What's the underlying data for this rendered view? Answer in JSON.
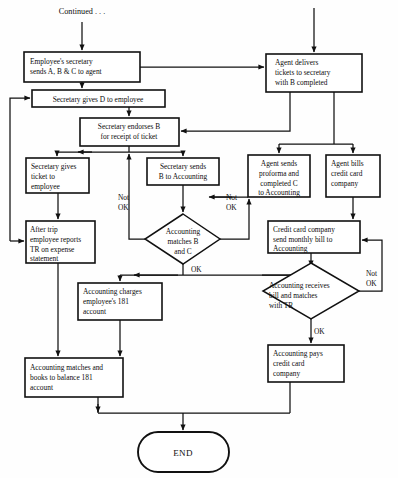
{
  "diagram": {
    "type": "flowchart",
    "canvas": {
      "width": 398,
      "height": 478
    },
    "colors": {
      "stroke": "#111111",
      "fill": "#ffffff",
      "text": "#0d0d0d",
      "background": "#ffffff"
    }
  },
  "entry": {
    "label": "Continued . . ."
  },
  "nodes": [
    {
      "id": "employee-secretary-sends",
      "shape": "process",
      "lines": [
        "Employee's secretary",
        "sends A, B & C to agent"
      ],
      "x": 24,
      "y": 52,
      "w": 116,
      "h": 30
    },
    {
      "id": "agent-delivers-tickets",
      "shape": "process",
      "lines": [
        "Agent delivers",
        "tickets to secretary",
        "with B completed"
      ],
      "x": 266,
      "y": 54,
      "w": 96,
      "h": 38
    },
    {
      "id": "secretary-gives-d",
      "shape": "process",
      "lines": [
        "Secretary gives D to employee"
      ],
      "x": 32,
      "y": 90,
      "w": 133,
      "h": 17
    },
    {
      "id": "secretary-endorses-b",
      "shape": "process",
      "lines": [
        "Secretary endorses B",
        "for receipt of ticket"
      ],
      "x": 80,
      "y": 118,
      "w": 99,
      "h": 28
    },
    {
      "id": "secretary-gives-ticket",
      "shape": "process",
      "lines": [
        "Secretary gives",
        "ticket to",
        "employee"
      ],
      "x": 26,
      "y": 158,
      "w": 63,
      "h": 35
    },
    {
      "id": "secretary-sends-b",
      "shape": "process",
      "lines": [
        "Secretary sends",
        "B to Accounting"
      ],
      "x": 147,
      "y": 158,
      "w": 72,
      "h": 27
    },
    {
      "id": "agent-sends-proforma",
      "shape": "process",
      "lines": [
        "Agent sends",
        "proforma and",
        "completed C",
        "to Accounting"
      ],
      "x": 248,
      "y": 155,
      "w": 62,
      "h": 42
    },
    {
      "id": "agent-bills-credit-card",
      "shape": "process",
      "lines": [
        "Agent bills",
        "credit card",
        "company"
      ],
      "x": 326,
      "y": 155,
      "w": 54,
      "h": 42
    },
    {
      "id": "after-trip-reports",
      "shape": "process",
      "lines": [
        "After trip",
        "employee reports",
        "TR on expense",
        "statement"
      ],
      "x": 26,
      "y": 221,
      "w": 69,
      "h": 42
    },
    {
      "id": "accounting-matches-b-c",
      "shape": "decision",
      "lines": [
        "Accounting",
        "matches B",
        "and C"
      ],
      "x": 145,
      "y": 214,
      "w": 75,
      "h": 50
    },
    {
      "id": "credit-card-monthly-bill",
      "shape": "process",
      "lines": [
        "Credit card company",
        "send monthly bill to",
        "Accounting"
      ],
      "x": 268,
      "y": 221,
      "w": 92,
      "h": 32
    },
    {
      "id": "accounting-charges-181",
      "shape": "process",
      "lines": [
        "Accounting charges",
        "employee's 181",
        "account"
      ],
      "x": 78,
      "y": 283,
      "w": 84,
      "h": 37
    },
    {
      "id": "accounting-receives-bill",
      "shape": "decision",
      "lines": [
        "Accounting receives",
        "bill and matches",
        "with TR"
      ],
      "x": 263,
      "y": 263,
      "w": 96,
      "h": 56
    },
    {
      "id": "accounting-pays-credit-card",
      "shape": "process",
      "lines": [
        "Accounting pays",
        "credit card",
        "company"
      ],
      "x": 268,
      "y": 345,
      "w": 76,
      "h": 37
    },
    {
      "id": "accounting-matches-books",
      "shape": "process",
      "lines": [
        "Accounting matches and",
        "books to balance 181",
        "account"
      ],
      "x": 25,
      "y": 358,
      "w": 98,
      "h": 39
    },
    {
      "id": "end-terminator",
      "shape": "terminator",
      "lines": [
        "END"
      ],
      "x": 138,
      "y": 432,
      "w": 91,
      "h": 40
    }
  ],
  "edge_labels": [
    {
      "id": "not-ok-left",
      "lines": [
        "Not",
        "OK"
      ],
      "x": 125,
      "y": 196
    },
    {
      "id": "not-ok-middle",
      "lines": [
        "Not",
        "OK"
      ],
      "x": 232,
      "y": 196
    },
    {
      "id": "ok-center",
      "lines": [
        "OK"
      ],
      "x": 197,
      "y": 265
    },
    {
      "id": "not-ok-right",
      "lines": [
        "Not",
        "OK"
      ],
      "x": 374,
      "y": 258
    },
    {
      "id": "ok-right",
      "lines": [
        "OK"
      ],
      "x": 314,
      "y": 329
    }
  ]
}
